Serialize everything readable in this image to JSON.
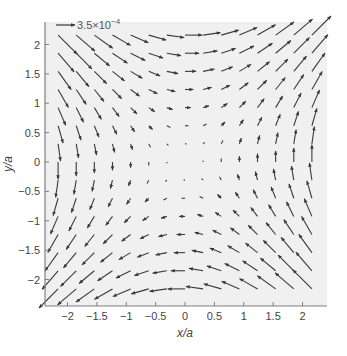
{
  "chart_data": {
    "type": "quiver",
    "title": "",
    "xlabel": "x/a",
    "ylabel": "y/a",
    "xlim": [
      -2.4,
      2.4
    ],
    "ylim": [
      -2.4,
      2.4
    ],
    "xticks": [
      -2,
      -1.5,
      -1,
      -0.5,
      0,
      0.5,
      1,
      1.5,
      2
    ],
    "yticks": [
      -2,
      -1.5,
      -1,
      -0.5,
      0,
      0.5,
      1,
      1.5,
      2
    ],
    "xtick_labels": [
      "−2",
      "−1.5",
      "−1",
      "−0.5",
      "0",
      "0.5",
      "1",
      "1.5",
      "2"
    ],
    "ytick_labels": [
      "−2",
      "−1.5",
      "−1",
      "−0.5",
      "0",
      "0.5",
      "1",
      "1.5",
      "2"
    ],
    "grid": false,
    "legend": {
      "reference_arrow_label": "3.5×10",
      "reference_arrow_exponent": "−4",
      "position": "top-left"
    },
    "vector_field": {
      "description": "Hyperbolic (saddle) field: direction (u,v) ∝ (y, x); magnitude grows with distance from origin",
      "grid_x": {
        "start": -2.16,
        "stop": 2.16,
        "count": 15
      },
      "grid_y": {
        "start": -2.16,
        "stop": 2.16,
        "count": 15
      },
      "u_formula": "y",
      "v_formula": "x",
      "magnitude_exponent": 1.3,
      "max_arrow_length_units": 0.46
    },
    "colors": {
      "arrow": "#3a3a3a",
      "plot_background": "#f0f0f0",
      "axis": "#808080"
    }
  }
}
